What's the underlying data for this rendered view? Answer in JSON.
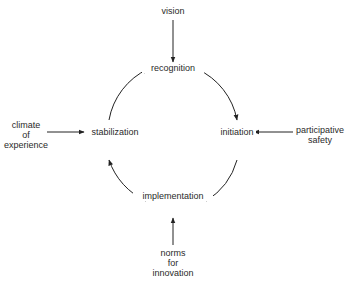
{
  "diagram": {
    "cycle_nodes": {
      "top": "recognition",
      "right": "initiation",
      "bottom": "implementation",
      "left": "stabilization"
    },
    "inputs": {
      "top": [
        "vision"
      ],
      "right": [
        "participative",
        "safety"
      ],
      "bottom": [
        "norms",
        "for",
        "innovation"
      ],
      "left": [
        "climate",
        "of",
        "experience"
      ]
    },
    "edges": [
      {
        "from": "recognition",
        "to": "initiation"
      },
      {
        "from": "initiation",
        "to": "implementation"
      },
      {
        "from": "implementation",
        "to": "stabilization"
      },
      {
        "from": "stabilization",
        "to": "recognition"
      },
      {
        "from": "vision",
        "to": "recognition"
      },
      {
        "from": "participative safety",
        "to": "initiation"
      },
      {
        "from": "norms for innovation",
        "to": "implementation"
      },
      {
        "from": "climate of experience",
        "to": "stabilization"
      }
    ],
    "colors": {
      "line": "#222222",
      "text": "#2a2a2a",
      "background": "#ffffff"
    }
  }
}
